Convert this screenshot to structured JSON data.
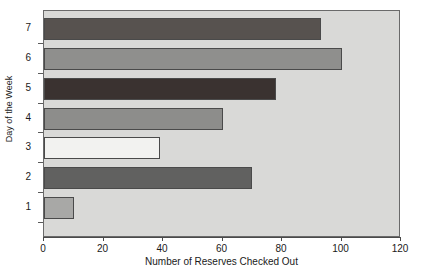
{
  "chart_data": {
    "type": "bar",
    "orientation": "horizontal",
    "title": "",
    "xlabel": "Number of Reserves Checked Out",
    "ylabel": "Day of the Week",
    "categories": [
      "1",
      "2",
      "3",
      "4",
      "5",
      "6",
      "7"
    ],
    "values": [
      10,
      70,
      39,
      60,
      78,
      100,
      93
    ],
    "bar_colors": [
      "#a8a8a6",
      "#616160",
      "#f2f2f0",
      "#8d8d8b",
      "#3a3230",
      "#8f8f8d",
      "#57524f"
    ],
    "xlim": [
      0,
      120
    ],
    "ylim": [
      0,
      7.6
    ],
    "xticks": [
      0,
      20,
      40,
      60,
      80,
      100,
      120
    ],
    "xtick_labels": [
      "0",
      "20",
      "40",
      "60",
      "80",
      "100",
      "120"
    ],
    "yticks": [
      1,
      2,
      3,
      4,
      5,
      6,
      7
    ],
    "ytick_labels": [
      "1",
      "2",
      "3",
      "4",
      "5",
      "6",
      "7"
    ],
    "grid": false,
    "legend": null,
    "plot_background": "#d9d9d7",
    "frame_color": "#6a6a6a",
    "bar_edge_color": "#4a4a4a"
  }
}
